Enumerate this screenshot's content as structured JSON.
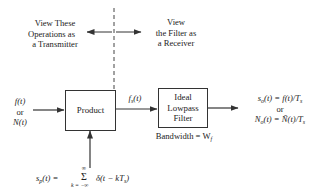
{
  "annotations": {
    "transmitter_view": [
      "View These",
      "Operations as",
      "a Transmitter"
    ],
    "receiver_view": [
      "View",
      "the Filter as",
      "a Receiver"
    ]
  },
  "input": {
    "line1": "f(t)",
    "line2": "or",
    "line3": "N(t)"
  },
  "blocks": {
    "product": {
      "label": "Product"
    },
    "filter": {
      "label_lines": [
        "Ideal",
        "Lowpass",
        "Filter"
      ],
      "bandwidth_label": "Bandwidth = W",
      "bandwidth_sub": "f"
    }
  },
  "signals": {
    "sampled": {
      "main": "f",
      "sub": "s",
      "arg": "(t)"
    },
    "sampling_function": {
      "lhs_main": "s",
      "lhs_sub": "p",
      "lhs_arg": "(t) =",
      "sum_upper": "∞",
      "sum_symbol": "Σ",
      "sum_lower": "k = −∞",
      "summand": "δ(t − kT",
      "summand_sub": "s",
      "summand_close": ")"
    },
    "output": {
      "line1": "sₒ(t) = f(t)/Tₛ",
      "line1_parts": {
        "a": "s",
        "a_sub": "o",
        "b": "(t) = f(t)/T",
        "b_sub": "s"
      },
      "line2": "or",
      "line3_parts": {
        "a": "N",
        "a_sub": "o",
        "b": "(t) = Ñ(t)/T",
        "b_sub": "s"
      }
    }
  },
  "colors": {
    "line": "#333333",
    "text": "#222222",
    "background": "#ffffff"
  }
}
